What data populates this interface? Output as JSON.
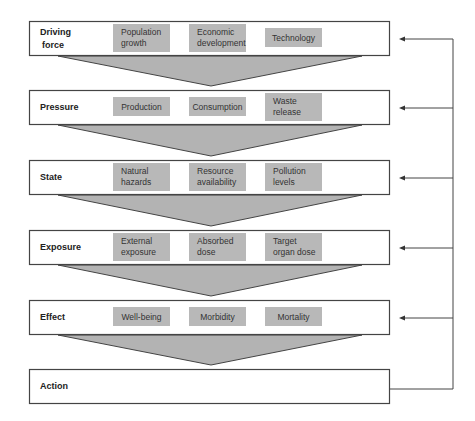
{
  "diagram": {
    "type": "DPSEEA framework flow",
    "stages": [
      {
        "label_lines": [
          "Driving",
          "force"
        ],
        "factors": [
          [
            "Population",
            "growth"
          ],
          [
            "Economic",
            "development"
          ],
          [
            "Technology"
          ]
        ]
      },
      {
        "label_lines": [
          "Pressure"
        ],
        "factors": [
          [
            "Production"
          ],
          [
            "Consumption"
          ],
          [
            "Waste",
            "release"
          ]
        ]
      },
      {
        "label_lines": [
          "State"
        ],
        "factors": [
          [
            "Natural",
            "hazards"
          ],
          [
            "Resource",
            "availability"
          ],
          [
            "Pollution",
            "levels"
          ]
        ]
      },
      {
        "label_lines": [
          "Exposure"
        ],
        "factors": [
          [
            "External",
            "exposure"
          ],
          [
            "Absorbed",
            "dose"
          ],
          [
            "Target",
            "organ dose"
          ]
        ]
      },
      {
        "label_lines": [
          "Effect"
        ],
        "factors": [
          [
            "Well-being"
          ],
          [
            "Morbidity"
          ],
          [
            "Mortality"
          ]
        ]
      },
      {
        "label_lines": [
          "Action"
        ],
        "factors": []
      }
    ],
    "feedback": "Action feeds back to every stage above",
    "colors": {
      "box_border": "#444444",
      "factor_fill": "#b8b8b8",
      "funnel_fill": "#b3b3b3",
      "line": "#444444"
    }
  }
}
